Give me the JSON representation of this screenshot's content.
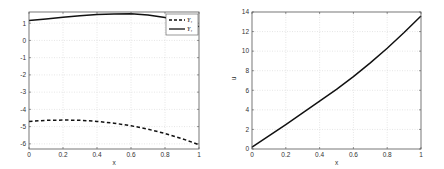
{
  "chart_data": [
    {
      "type": "line",
      "title": "",
      "xlabel": "x",
      "ylabel": "",
      "xlim": [
        0,
        1
      ],
      "ylim": [
        -6.3,
        1.65
      ],
      "grid": true,
      "x_ticks": [
        0,
        0.2,
        0.4,
        0.6,
        0.8,
        1
      ],
      "x_tick_labels": [
        "0",
        "0.2",
        "0.4",
        "0.6",
        "0.8",
        "1"
      ],
      "y_ticks": [
        -6,
        -5,
        -4,
        -3,
        -2,
        -1,
        0,
        1
      ],
      "y_tick_labels": [
        "-6",
        "-5",
        "-4",
        "-3",
        "-2",
        "-1",
        "0",
        "1"
      ],
      "legend": {
        "placement": "top-right",
        "entries": [
          "Y₁",
          "Y₁"
        ]
      },
      "series": [
        {
          "name": "Y₁",
          "style": "dashed",
          "color": "#111111",
          "x": [
            0,
            0.1,
            0.2,
            0.3,
            0.4,
            0.5,
            0.6,
            0.7,
            0.8,
            0.9,
            1
          ],
          "y": [
            -4.7,
            -4.64,
            -4.62,
            -4.63,
            -4.7,
            -4.8,
            -4.95,
            -5.15,
            -5.4,
            -5.7,
            -6.05
          ]
        },
        {
          "name": "Y₁",
          "style": "solid",
          "color": "#111111",
          "x": [
            0,
            0.1,
            0.2,
            0.3,
            0.4,
            0.5,
            0.6,
            0.7,
            0.8,
            0.9,
            1
          ],
          "y": [
            1.15,
            1.25,
            1.35,
            1.43,
            1.5,
            1.54,
            1.55,
            1.48,
            1.33,
            1.1,
            0.8
          ]
        }
      ]
    },
    {
      "type": "line",
      "title": "",
      "xlabel": "x",
      "ylabel": "u",
      "xlim": [
        0,
        1
      ],
      "ylim": [
        0,
        14
      ],
      "grid": true,
      "x_ticks": [
        0,
        0.2,
        0.4,
        0.6,
        0.8,
        1
      ],
      "x_tick_labels": [
        "0",
        "0.2",
        "0.4",
        "0.6",
        "0.8",
        "1"
      ],
      "y_ticks": [
        0,
        2,
        4,
        6,
        8,
        10,
        12,
        14
      ],
      "y_tick_labels": [
        "0",
        "2",
        "4",
        "6",
        "8",
        "10",
        "12",
        "14"
      ],
      "series": [
        {
          "name": "u",
          "style": "solid",
          "color": "#111111",
          "x": [
            0,
            0.1,
            0.2,
            0.3,
            0.4,
            0.5,
            0.6,
            0.7,
            0.8,
            0.9,
            1
          ],
          "y": [
            0.2,
            1.35,
            2.5,
            3.7,
            4.9,
            6.1,
            7.4,
            8.8,
            10.3,
            11.9,
            13.6
          ]
        }
      ]
    }
  ]
}
